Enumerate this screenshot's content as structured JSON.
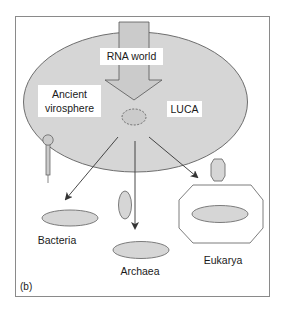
{
  "figure": {
    "panel_label": "(b)",
    "colors": {
      "frame_stroke": "#8a8a8a",
      "cell_fill": "#d6d6d6",
      "cell_stroke": "#6e6e6e",
      "arrow_fill": "#cbcbcb",
      "line": "#333333",
      "label_bg": "#ffffff"
    }
  },
  "labels": {
    "rna_world": "RNA world",
    "ancient_virosphere_line1": "Ancient",
    "ancient_virosphere_line2": "virosphere",
    "luca": "LUCA",
    "bacteria": "Bacteria",
    "archaea": "Archaea",
    "eukarya": "Eukarya"
  },
  "nodes": [
    {
      "id": "rna-world",
      "label": "RNA world"
    },
    {
      "id": "ancient-virosphere",
      "label": "Ancient virosphere"
    },
    {
      "id": "luca",
      "label": "LUCA"
    },
    {
      "id": "bacteria",
      "label": "Bacteria"
    },
    {
      "id": "archaea",
      "label": "Archaea"
    },
    {
      "id": "eukarya",
      "label": "Eukarya"
    }
  ],
  "edges": [
    {
      "from": "rna-world",
      "to": "luca",
      "style": "block-arrow"
    },
    {
      "from": "luca",
      "to": "bacteria",
      "style": "line-arrow"
    },
    {
      "from": "luca",
      "to": "archaea",
      "style": "line-arrow"
    },
    {
      "from": "luca",
      "to": "eukarya",
      "style": "line-arrow"
    }
  ]
}
